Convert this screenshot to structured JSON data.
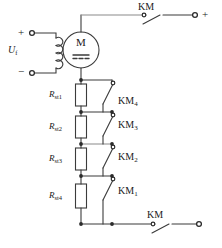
{
  "diagram": {
    "colors": {
      "wire": "#3b3b3b",
      "wire_light": "#8a8a8a",
      "text": "#1a1a1a",
      "background": "#ffffff"
    }
  },
  "supply": {
    "field_label": "U",
    "field_sub": "f",
    "plus_terminal": "+",
    "minus_terminal": "−",
    "coil_name": "field-winding"
  },
  "motor": {
    "symbol_letter": "M",
    "type_marking": "dc-symbol"
  },
  "contactors": {
    "top": {
      "label": "KM",
      "terminal_label": "+"
    },
    "bottom": {
      "label": "KM",
      "terminal_label": ""
    }
  },
  "stages": [
    {
      "resistor_label": "R",
      "resistor_sub": "st1",
      "contact_label": "KM",
      "contact_sub": "4"
    },
    {
      "resistor_label": "R",
      "resistor_sub": "st2",
      "contact_label": "KM",
      "contact_sub": "3"
    },
    {
      "resistor_label": "R",
      "resistor_sub": "st3",
      "contact_label": "KM",
      "contact_sub": "2"
    },
    {
      "resistor_label": "R",
      "resistor_sub": "st4",
      "contact_label": "KM",
      "contact_sub": "1"
    }
  ]
}
